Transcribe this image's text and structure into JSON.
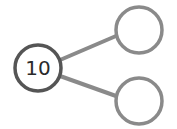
{
  "diagram": {
    "type": "number-bond",
    "whole": {
      "value": "10",
      "stroke": "#555555"
    },
    "parts": [
      {
        "value": "",
        "stroke": "#8a8a8a"
      },
      {
        "value": "",
        "stroke": "#8a8a8a"
      }
    ],
    "connector_color": "#8a8a8a"
  }
}
